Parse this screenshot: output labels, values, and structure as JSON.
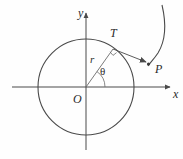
{
  "figure": {
    "background_color": "#fefefe",
    "stroke_color": "#4a4a4a",
    "label_color": "#2b2b2b",
    "axes": {
      "y_axis_label": "y",
      "x_axis_label": "x",
      "origin_label": "O",
      "origin_px": [
        86,
        87
      ],
      "x_axis_start_px": [
        12,
        87
      ],
      "x_axis_end_px": [
        172,
        87
      ],
      "y_axis_start_px": [
        86,
        150
      ],
      "y_axis_end_px": [
        86,
        11
      ]
    },
    "circle": {
      "center_px": [
        86,
        87
      ],
      "radius_px": 48
    },
    "points": [
      {
        "name": "T",
        "label": "T",
        "px": [
          113,
          49
        ],
        "description": "tangency point on circle"
      },
      {
        "name": "P",
        "label": "P",
        "px": [
          149,
          64
        ],
        "description": "point on involute curve"
      },
      {
        "name": "O",
        "label": "O",
        "px": [
          86,
          87
        ],
        "description": "center / origin"
      }
    ],
    "segments": [
      {
        "name": "radius-OT",
        "label": "r",
        "from": "O",
        "to": "T"
      },
      {
        "name": "tangent-TP",
        "from": "T",
        "to": "P",
        "arrowhead": true
      }
    ],
    "angle": {
      "label": "θ",
      "vertex": "O",
      "from_ray": "positive x-axis",
      "to_ray": "radius OT",
      "value_deg": 55
    },
    "right_angle_marker": {
      "at": "T",
      "description": "square marker indicating OT perpendicular to TP"
    },
    "involute_curve": {
      "name": "involute-of-circle",
      "start_px": [
        162,
        5
      ],
      "end_px": [
        149,
        66
      ]
    }
  }
}
